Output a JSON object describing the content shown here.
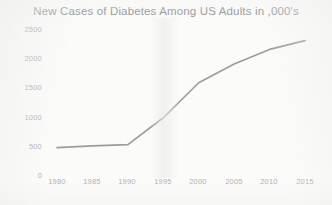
{
  "chart_data": {
    "type": "line",
    "title": "New Cases of Diabetes Among US Adults in ,000's",
    "xlabel": "",
    "ylabel": "",
    "x": [
      1980,
      1985,
      1990,
      1995,
      2000,
      2005,
      2010,
      2015
    ],
    "series": [
      {
        "name": "New cases of diabetes",
        "values": [
          470,
          500,
          520,
          980,
          1580,
          1900,
          2150,
          2300
        ]
      }
    ],
    "xticks": [
      "1980",
      "1985",
      "1990",
      "1995",
      "2000",
      "2005",
      "2010",
      "2015"
    ],
    "yticks": [
      "0",
      "500",
      "1000",
      "1500",
      "2000",
      "2500"
    ],
    "xlim": [
      1978,
      2017
    ],
    "ylim": [
      0,
      2500
    ],
    "grid": false,
    "legend": false,
    "markers": false,
    "line_color": "#9d9d9b",
    "text_color": "#6f6f6f",
    "tick_color": "#b0b0ae",
    "background_color": "#fbfbfa"
  }
}
